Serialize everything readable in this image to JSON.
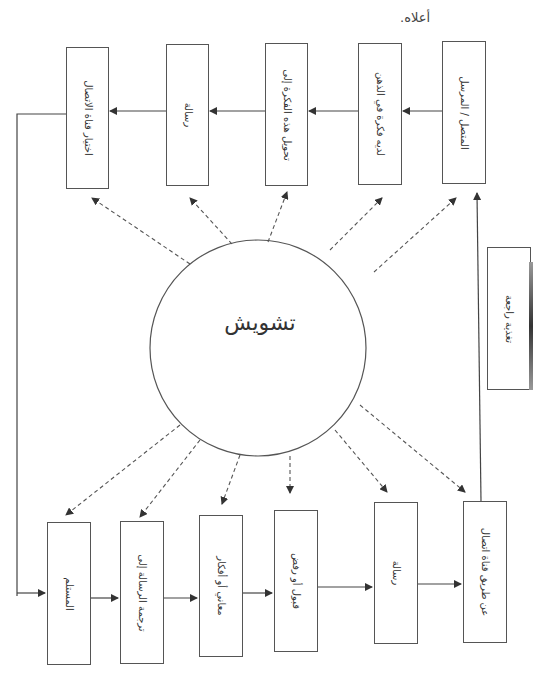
{
  "header": {
    "line1": "... الموضح في الشكل",
    "line2": "أعلاه."
  },
  "center": {
    "label": "تشويش"
  },
  "top_row": [
    {
      "id": "sender",
      "label": "المتصل / المرسل"
    },
    {
      "id": "idea",
      "label": "لديه فكرة في الذهن"
    },
    {
      "id": "encode",
      "label": "تحويل هذه الفكرة إلى"
    },
    {
      "id": "message",
      "label": "رسالة"
    },
    {
      "id": "channel",
      "label": "اختيار قناة الاتصال"
    }
  ],
  "bottom_row": [
    {
      "id": "receiver",
      "label": "المستلم"
    },
    {
      "id": "decode",
      "label": "ترجمة الرسالة إلى"
    },
    {
      "id": "meanings",
      "label": "معاني أو أفكار"
    },
    {
      "id": "accept",
      "label": "قبول أو رفض"
    },
    {
      "id": "message2",
      "label": "رسالة"
    },
    {
      "id": "via_channel",
      "label": "عن طريق قناة اتصال"
    }
  ],
  "feedback": {
    "label": "تغذية راجعة"
  },
  "colors": {
    "stroke": "#555555",
    "text": "#333333",
    "background": "#ffffff"
  }
}
